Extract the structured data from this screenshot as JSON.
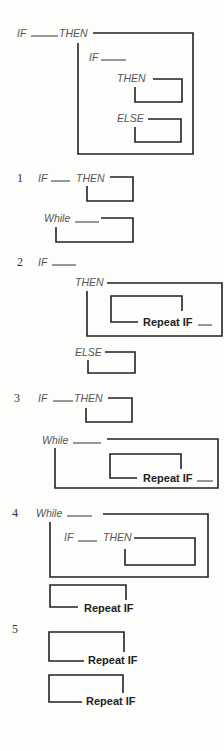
{
  "figure": {
    "header": {
      "if": "IF",
      "then": "THEN",
      "inner_if": "IF",
      "inner_then": "THEN",
      "inner_else": "ELSE"
    },
    "items": [
      {
        "num": "1",
        "if": "IF",
        "then": "THEN",
        "while": "While"
      },
      {
        "num": "2",
        "if": "IF",
        "then": "THEN",
        "repeat": "Repeat IF",
        "else": "ELSE"
      },
      {
        "num": "3",
        "if": "IF",
        "then": "THEN",
        "while": "While",
        "repeat": "Repeat IF"
      },
      {
        "num": "4",
        "while": "While",
        "if": "IF",
        "then": "THEN",
        "repeat": "Repeat IF"
      },
      {
        "num": "5",
        "repeat1": "Repeat IF",
        "repeat2": "Repeat IF"
      }
    ]
  }
}
